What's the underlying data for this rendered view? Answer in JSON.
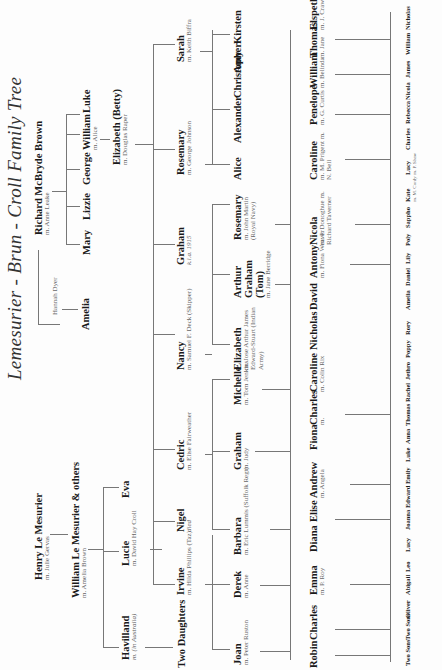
{
  "title": "Lemesurier - Brun - Croll Family Tree",
  "line_color": "#777777",
  "text_color": "#1a1a1a",
  "spouse_color": "#666666",
  "people": {
    "henry": {
      "name": "Henry Le Mesurier",
      "spouse": "m. Julie Gervas"
    },
    "william_lm": {
      "name": "William Le Mesurier & others",
      "spouse": "m. Amelia Brown"
    },
    "havilland": {
      "name": "Havilland",
      "spouse": "m. (in Australia)"
    },
    "lucie": {
      "name": "Lucie",
      "spouse": "m. David Hay Croll"
    },
    "eva": {
      "name": "Eva"
    },
    "two_daughters": {
      "name": "Two Daughters"
    },
    "irvine": {
      "name": "Irvine",
      "spouse": "m. Hilda Phillips (Taz)"
    },
    "nigel": {
      "name": "Nigel",
      "note": "died"
    },
    "cedric": {
      "name": "Cedric",
      "spouse": "m. Elise Fairweather"
    },
    "nancy": {
      "name": "Nancy",
      "spouse": "m. Samuel F. Deck (Skipper)"
    },
    "graham_kia": {
      "name": "Graham",
      "note": "k.i.a. 1915"
    },
    "rosemary_j": {
      "name": "Rosemary",
      "spouse": "m. George Johnson"
    },
    "sarah": {
      "name": "Sarah",
      "spouse": "m. Keith Biffra"
    },
    "richard": {
      "name": "Richard McBryde Brown",
      "spouse": "m. Anne Leake"
    },
    "hannah": {
      "name": "Hannah Dyer"
    },
    "amelia_b": {
      "name": "Amelia"
    },
    "mary": {
      "name": "Mary"
    },
    "lizzie": {
      "name": "Lizzie"
    },
    "george": {
      "name": "George"
    },
    "william_b": {
      "name": "William",
      "spouse": "m. Alice"
    },
    "luke": {
      "name": "Luke"
    },
    "betty": {
      "name": "Elizabeth (Betty)",
      "spouse": "m. Douglas Raper"
    },
    "joan": {
      "name": "Joan",
      "spouse": "m. Peter Ruston"
    },
    "derek": {
      "name": "Derek",
      "spouse": "m. Anne"
    },
    "barbara": {
      "name": "Barbara",
      "spouse": "m. Eric Lummis (Suffolk Regt)"
    },
    "graham_j": {
      "name": "Graham",
      "spouse": "m. Judy"
    },
    "michelle": {
      "name": "Michelle",
      "spouse": "m. Tom Jenkins"
    },
    "elizabeth_n": {
      "name": "Elizabeth",
      "spouse": "m. Jose Arthur James Edward-Stuart (Indian Army)"
    },
    "arthur": {
      "name": "Arthur Graham (Tom)",
      "spouse": "m. Jane Berridge"
    },
    "rosemary_m": {
      "name": "Rosemary",
      "spouse": "m. John Martin (Royal Navy)"
    },
    "alice": {
      "name": "Alice"
    },
    "alexander": {
      "name": "Alexander"
    },
    "christopher": {
      "name": "Christopher"
    },
    "amy": {
      "name": "Amy"
    },
    "kirsten": {
      "name": "Kirsten"
    },
    "robin": {
      "name": "Robin"
    },
    "charles_r": {
      "name": "Charles"
    },
    "emma": {
      "name": "Emma",
      "spouse": "m. P. Roy"
    },
    "diana": {
      "name": "Diana"
    },
    "elise": {
      "name": "Elise"
    },
    "andrew": {
      "name": "Andrew",
      "spouse": "m. Angela"
    },
    "fiona": {
      "name": "Fiona"
    },
    "charles_m": {
      "name": "Charles",
      "spouse": "m."
    },
    "caroline_r": {
      "name": "Caroline",
      "spouse": "m. Colin Rix"
    },
    "nicholas_e": {
      "name": "Nicholas"
    },
    "david": {
      "name": "David"
    },
    "antony": {
      "name": "Antony",
      "spouse": "m. Fiona Weaver"
    },
    "nicola": {
      "name": "Nicola",
      "spouse": "m. P. Donoghue m. Richard Taverner"
    },
    "caroline_p": {
      "name": "Caroline",
      "spouse": "m. M. Prigent m. N. Bell"
    },
    "penelope": {
      "name": "Penelope",
      "spouse": "m. G. Curtis"
    },
    "william_c": {
      "name": "William",
      "spouse": "m. Belinda"
    },
    "thomas": {
      "name": "Thomas",
      "spouse": "m. Jane"
    },
    "elspeth": {
      "name": "Elspeth",
      "spouse": "m. J. Crawford"
    },
    "two_sons_1": {
      "name": "Two Sons"
    },
    "two_sons_2": {
      "name": "Two Sons",
      "prefix": "Two"
    },
    "oliver": {
      "name": "Oliver"
    },
    "abigail": {
      "name": "Abigail"
    },
    "leo": {
      "name": "Leo"
    },
    "lucy_e": {
      "name": "Lucy"
    },
    "joanna": {
      "name": "Joanna"
    },
    "edward": {
      "name": "Edward"
    },
    "emily": {
      "name": "Emily"
    },
    "luke_g": {
      "name": "Luke"
    },
    "anna": {
      "name": "Anna"
    },
    "thomas_g": {
      "name": "Thomas"
    },
    "rachel": {
      "name": "Rachel"
    },
    "jethro": {
      "name": "Jethro"
    },
    "poppy": {
      "name": "Poppy"
    },
    "rory": {
      "name": "Rory"
    },
    "amelia_g": {
      "name": "Amelia"
    },
    "daniel": {
      "name": "Daniel"
    },
    "lily": {
      "name": "Lily"
    },
    "poly": {
      "name": "Poly"
    },
    "sappho": {
      "name": "Sappho"
    },
    "kate": {
      "name": "Kate",
      "spouse": "m. M. Cordy"
    },
    "lucy_p": {
      "name": "Lucy",
      "spouse": "m. P. Shaw"
    },
    "charles_c": {
      "name": "Charles"
    },
    "rebecca": {
      "name": "Rebecca"
    },
    "nicola_w": {
      "name": "Nicola"
    },
    "james": {
      "name": "James"
    },
    "william_t": {
      "name": "William"
    },
    "nicholas_t": {
      "name": "Nicholas"
    }
  }
}
